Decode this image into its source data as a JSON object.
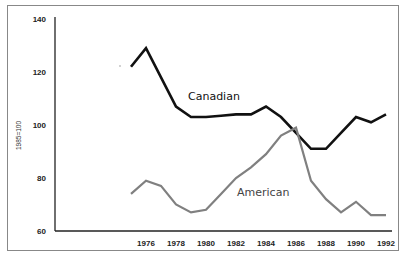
{
  "chart_data": {
    "type": "line",
    "title": "",
    "xlabel": "",
    "ylabel": "1985=100",
    "ylim": [
      60,
      140
    ],
    "yticks": [
      60,
      80,
      100,
      120,
      140
    ],
    "xticks": [
      "1976",
      "1978",
      "1980",
      "1982",
      "1984",
      "1986",
      "1988",
      "1990",
      "1992"
    ],
    "grid": false,
    "legend": "inline labels",
    "x": [
      1975,
      1976,
      1977,
      1978,
      1979,
      1980,
      1981,
      1982,
      1983,
      1984,
      1985,
      1986,
      1987,
      1988,
      1989,
      1990,
      1991,
      1992
    ],
    "series": [
      {
        "name": "Canadian",
        "color": "#111111",
        "values": [
          122,
          129,
          118,
          107,
          103,
          103,
          103.5,
          104,
          104,
          107,
          103,
          97,
          91,
          91,
          97,
          103,
          101,
          104
        ]
      },
      {
        "name": "American",
        "color": "#808080",
        "values": [
          74,
          79,
          77,
          70,
          67,
          68,
          74,
          80,
          84,
          89,
          96,
          99,
          79,
          72,
          67,
          71,
          66,
          66
        ]
      }
    ]
  }
}
